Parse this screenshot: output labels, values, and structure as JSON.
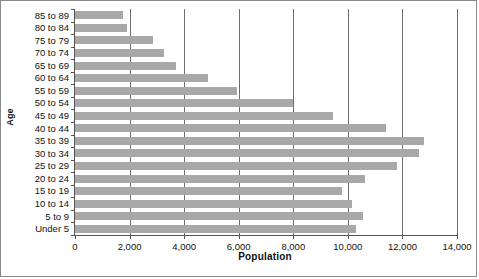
{
  "chart_data": {
    "type": "bar",
    "orientation": "horizontal",
    "title": "",
    "xlabel": "Population",
    "ylabel": "Age",
    "categories": [
      "85 to 89",
      "80 to 84",
      "75 to 79",
      "70 to 74",
      "65 to 69",
      "60 to 64",
      "55 to 59",
      "50 to 54",
      "45 to 49",
      "40 to 44",
      "35 to 39",
      "30 to 34",
      "25 to 29",
      "20 to 24",
      "15 to 19",
      "10 to 14",
      "5 to 9",
      "Under 5"
    ],
    "values": [
      1750,
      1900,
      2850,
      3270,
      3700,
      4860,
      5950,
      7980,
      9450,
      11400,
      12780,
      12600,
      11800,
      10640,
      9800,
      10170,
      10570,
      10300
    ],
    "xlim": [
      0,
      14000
    ],
    "xticks": [
      0,
      2000,
      4000,
      6000,
      8000,
      10000,
      12000,
      14000
    ],
    "xtick_labels": [
      "0",
      "2,000",
      "4,000",
      "6,000",
      "8,000",
      "10,000",
      "12,000",
      "14,000"
    ],
    "grid": "vertical",
    "legend": "none",
    "bar_color": "#a8a8a8",
    "axis_color": "#555555",
    "gridline_color": "#6e6e6e",
    "border_color": "#8a8a8a"
  }
}
